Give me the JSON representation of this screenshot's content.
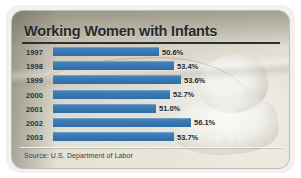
{
  "chart_data": {
    "type": "bar",
    "orientation": "horizontal",
    "title": "Working Women with Infants",
    "xlabel": "",
    "ylabel": "",
    "categories": [
      "1997",
      "1998",
      "1999",
      "2000",
      "2001",
      "2002",
      "2003"
    ],
    "values": [
      50.6,
      53.4,
      53.6,
      52.7,
      51.0,
      56.1,
      53.7
    ],
    "value_labels": [
      "50.6%",
      "53.4%",
      "53.6%",
      "52.7%",
      "51.0%",
      "56.1%",
      "53.7%"
    ],
    "series": [
      {
        "name": "Percent of women with infants in the labor force",
        "values": [
          50.6,
          53.4,
          53.6,
          52.7,
          51.0,
          56.1,
          53.7
        ]
      }
    ],
    "xlim": [
      0,
      60
    ],
    "grid": false,
    "legend": "none",
    "bar_color": "#3a78b4",
    "source": "Source: U.S. Department of Labor"
  },
  "card": {
    "title": "Working Women with Infants",
    "source": "Source: U.S. Department of Labor",
    "background_color": "#d9d6cb",
    "accent_color": "#3a78b4",
    "text_color": "#25282c"
  },
  "rows": [
    {
      "year": "1997",
      "value_label": "50.6%",
      "bar_px": 106,
      "label_x": 150
    },
    {
      "year": "1998",
      "value_label": "53.4%",
      "bar_px": 121,
      "label_x": 165
    },
    {
      "year": "1999",
      "value_label": "53.6%",
      "bar_px": 128,
      "label_x": 172
    },
    {
      "year": "2000",
      "value_label": "52.7%",
      "bar_px": 117,
      "label_x": 161
    },
    {
      "year": "2001",
      "value_label": "51.0%",
      "bar_px": 103,
      "label_x": 147
    },
    {
      "year": "2002",
      "value_label": "56.1%",
      "bar_px": 138,
      "label_x": 182
    },
    {
      "year": "2003",
      "value_label": "53.7%",
      "bar_px": 121,
      "label_x": 165
    }
  ]
}
